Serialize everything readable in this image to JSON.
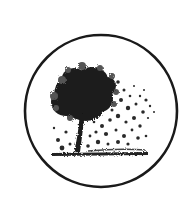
{
  "image": {
    "subject": "tree-in-circle-logo",
    "description": "Circular emblem containing a dark stippled tree whose leaves scatter to the right over a ground line",
    "colors": {
      "background": "#ffffff",
      "ink": "#1a1a1a"
    }
  }
}
